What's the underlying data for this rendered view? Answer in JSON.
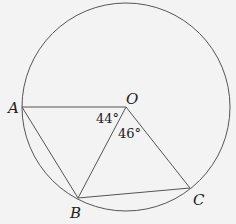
{
  "diagram": {
    "points": {
      "A": "A",
      "O": "O",
      "B": "B",
      "C": "C"
    },
    "angles": {
      "AOB": "44°",
      "BOC": "46°"
    },
    "segments": [
      "OA",
      "OB",
      "OC",
      "AB",
      "BC"
    ],
    "shape": "circle with center O"
  }
}
